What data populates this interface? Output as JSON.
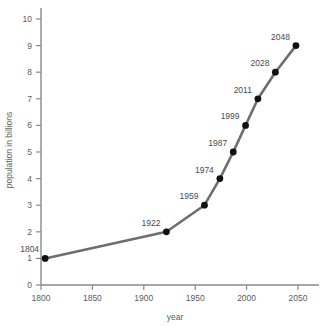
{
  "chart_data": {
    "type": "line",
    "title": "",
    "xlabel": "year",
    "ylabel": "population in billions",
    "xlim": [
      1795,
      2068
    ],
    "ylim": [
      0,
      10
    ],
    "grid": false,
    "legend": "none",
    "x": [
      1804,
      1922,
      1959,
      1974,
      1987,
      1999,
      2011,
      2028,
      2048
    ],
    "values": [
      1,
      2,
      3,
      4,
      5,
      6,
      7,
      8,
      9
    ],
    "point_labels": [
      "1804",
      "1922",
      "1959",
      "1974",
      "1987",
      "1999",
      "2011",
      "2028",
      "2048"
    ],
    "xticks": [
      1800,
      1850,
      1900,
      1950,
      2000,
      2050
    ],
    "xticklabels": [
      "1800",
      "1850",
      "1900",
      "1950",
      "2000",
      "2050"
    ],
    "yticks": [
      0,
      1,
      2,
      3,
      4,
      5,
      6,
      7,
      8,
      9,
      10
    ],
    "yticklabels": [
      "0",
      "1",
      "2",
      "3",
      "4",
      "5",
      "6",
      "7",
      "8",
      "9",
      "10"
    ],
    "series_color": "#6e6e6e",
    "marker_color": "#111111",
    "axis_color": "#8a8a8a",
    "text_color": "#5d5d5d",
    "background_color": "#ffffff"
  }
}
